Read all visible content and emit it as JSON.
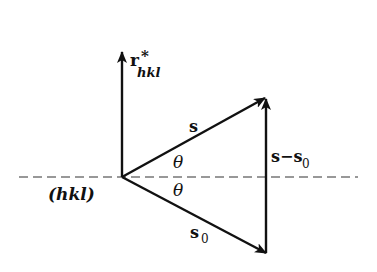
{
  "diagram": {
    "colors": {
      "stroke": "#111111",
      "dash": "#333333",
      "background": "#ffffff"
    },
    "plane_label": "(hkl)",
    "reciprocal_vector": {
      "symbol": "r",
      "superscript": "*",
      "subscript": "hkl"
    },
    "vectors": {
      "scattered": "s",
      "incident": "s",
      "incident_subscript": "0",
      "difference": "s−s",
      "difference_subscript": "0"
    },
    "angles": {
      "upper": "θ",
      "lower": "θ"
    }
  }
}
